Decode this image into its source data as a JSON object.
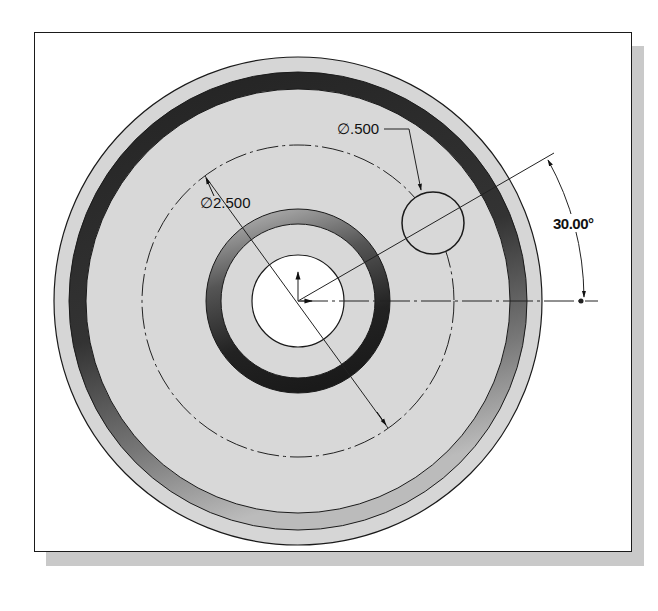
{
  "drawing": {
    "type": "CAD sketch - circular plate with hole pattern",
    "dimensions": {
      "bolt_circle_diameter": "∅2.500",
      "hole_diameter": "∅.500",
      "angle": "30.00°"
    },
    "colors": {
      "face_fill": "#d6d6d6",
      "dark_ring": "#2a2a2a",
      "line": "#1a1a1a",
      "frame_shadow": "#c9c9c9",
      "background": "#ffffff"
    }
  }
}
